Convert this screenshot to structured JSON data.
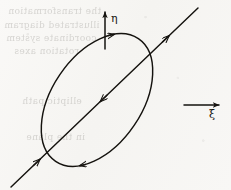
{
  "figure": {
    "name": "rotated-ellipse-with-axes",
    "background_color": "#f7f6f4",
    "ink_color": "#15130f",
    "width": 231,
    "height": 190
  },
  "labels": {
    "eta": "η",
    "xi": "ξ"
  },
  "axes": {
    "eta_axis": {
      "name": "eta-axis-arrow",
      "direction": "up",
      "x": 105,
      "y_start": 49,
      "y_end": 12,
      "label_x": 111,
      "label_y": 13
    },
    "xi_axis": {
      "name": "xi-axis-arrow",
      "direction": "right",
      "y": 105,
      "x_start": 184,
      "x_end": 219,
      "label_x": 209,
      "label_y": 109
    }
  },
  "ellipse": {
    "name": "trajectory-ellipse",
    "center_x": 97,
    "center_y": 100,
    "radius_major": 74,
    "radius_minor": 45,
    "rotation_deg": -56,
    "sense": "clockwise",
    "arrow_upper_left_deg": 150,
    "arrow_lower_right_deg": 330
  },
  "diagonal": {
    "name": "diagonal-line",
    "x1": 11,
    "y1": 187,
    "x2": 198,
    "y2": 8,
    "arrow_positions": [
      "lower-left",
      "center",
      "upper-right"
    ],
    "center_arrow_direction": "down-left",
    "end_arrow_direction": "up-right"
  },
  "bleed_text": [
    {
      "text": "the transformation",
      "x": 8,
      "y": 6
    },
    {
      "text": "illustrated diagram",
      "x": 4,
      "y": 20
    },
    {
      "text": "coordinate system",
      "x": 6,
      "y": 33
    },
    {
      "text": "rotation axes",
      "x": 14,
      "y": 46
    },
    {
      "text": "elliptic path",
      "x": 22,
      "y": 96
    },
    {
      "text": "in the plane",
      "x": 26,
      "y": 132
    }
  ]
}
